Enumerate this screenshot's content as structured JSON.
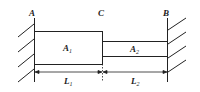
{
  "diagram": {
    "points": {
      "A": "A",
      "C": "C",
      "B": "B"
    },
    "segments": [
      {
        "area": "A",
        "area_sub": "1",
        "length": "L",
        "length_sub": "1"
      },
      {
        "area": "A",
        "area_sub": "2",
        "length": "L",
        "length_sub": "2"
      }
    ],
    "colors": {
      "line": "#222222",
      "background": "#ffffff"
    }
  }
}
